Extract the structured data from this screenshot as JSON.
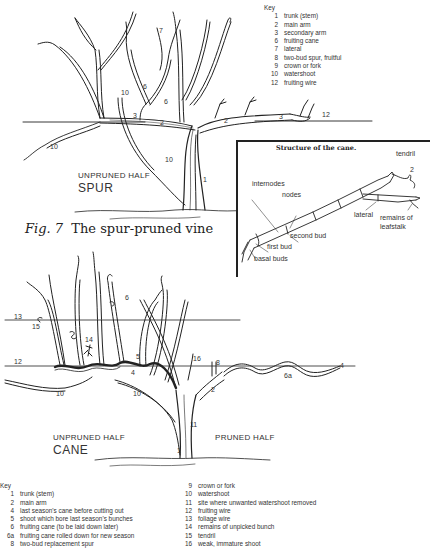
{
  "figure": {
    "caption_prefix": "Fig. 7",
    "caption_text": "The spur-pruned vine"
  },
  "spur_diagram": {
    "half_label": "UNPRUNED HALF",
    "type_label": "SPUR",
    "key": {
      "title": "Key",
      "items": [
        {
          "n": "1",
          "label": "trunk (stem)"
        },
        {
          "n": "2",
          "label": "main arm"
        },
        {
          "n": "3",
          "label": "secondary arm"
        },
        {
          "n": "6",
          "label": "fruiting cane"
        },
        {
          "n": "7",
          "label": "lateral"
        },
        {
          "n": "8",
          "label": "two-bud spur, fruitful"
        },
        {
          "n": "9",
          "label": "crown or fork"
        },
        {
          "n": "10",
          "label": "watershoot"
        },
        {
          "n": "12",
          "label": "fruiting wire"
        }
      ]
    },
    "callouts": {
      "n1": "1",
      "n2a": "2",
      "n2b": "2",
      "n3a": "3",
      "n3b": "3",
      "n6a": "6",
      "n6b": "6",
      "n7": "7",
      "n8": "8",
      "n9": "9",
      "n10a": "10",
      "n10b": "10",
      "n10c": "10",
      "n12": "12",
      "n4": "4"
    }
  },
  "cane_structure_inset": {
    "title": "Structure of the cane.",
    "labels": {
      "tendril": "tendril",
      "tendril_num": "2",
      "internodes": "internodes",
      "nodes": "nodes",
      "lateral": "lateral",
      "remains_of_leafstalk_1": "remains of",
      "remains_of_leafstalk_2": "leafstalk",
      "second_bud": "second bud",
      "first_bud": "first bud",
      "basal_buds": "basal buds"
    }
  },
  "cane_diagram": {
    "unpruned_label": "UNPRUNED HALF",
    "type_label": "CANE",
    "pruned_label": "PRUNED HALF",
    "callouts": {
      "n13": "13",
      "n15": "15",
      "n12": "12",
      "n14": "14",
      "n6": "6",
      "n5": "5",
      "n4": "4",
      "n16": "16",
      "n8": "8",
      "n2": "2",
      "n10a": "10",
      "n10b": "10",
      "n11": "11",
      "n1": "1",
      "n6a": "6a",
      "n4b": "4"
    },
    "key": {
      "title": "Key",
      "col1": [
        {
          "n": "1",
          "label": "trunk (stem)"
        },
        {
          "n": "2",
          "label": "main arm"
        },
        {
          "n": "4",
          "label": "last season's cane before cutting out"
        },
        {
          "n": "5",
          "label": "shoot which bore last season's bunches"
        },
        {
          "n": "6",
          "label": "fruiting cane (to be laid down later)"
        },
        {
          "n": "6a",
          "label": "fruiting cane rolled down for new season"
        },
        {
          "n": "8",
          "label": "two-bud replacement spur"
        }
      ],
      "col2": [
        {
          "n": "9",
          "label": "crown or fork"
        },
        {
          "n": "10",
          "label": "watershoot"
        },
        {
          "n": "11",
          "label": "site where unwanted watershoot removed"
        },
        {
          "n": "12",
          "label": "fruiting wire"
        },
        {
          "n": "13",
          "label": "foliage wire"
        },
        {
          "n": "14",
          "label": "remains of unpicked bunch"
        },
        {
          "n": "15",
          "label": "tendril"
        },
        {
          "n": "16",
          "label": "weak, immature shoot"
        }
      ]
    }
  }
}
